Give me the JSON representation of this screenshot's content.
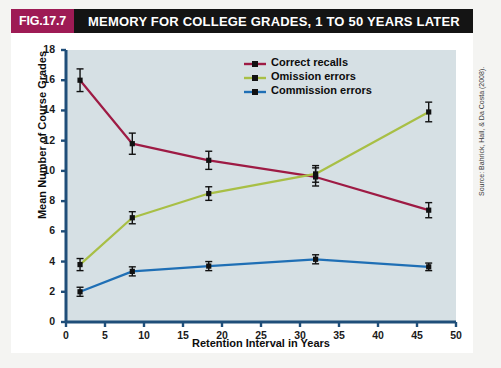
{
  "figure": {
    "badge": "FIG.17.7",
    "title": "MEMORY FOR COLLEGE GRADES, 1 TO 50 YEARS LATER",
    "badge_color": "#9e1b55",
    "title_bar_color": "#141414",
    "plot_background": "#d6e0e4",
    "axis_color": "#1f4e79",
    "source": "Source: Bahrick, Hall, & Da Costa (2008)."
  },
  "legend": {
    "position": "top-right",
    "entries": [
      {
        "label": "Correct recalls",
        "color": "#9e1b44"
      },
      {
        "label": "Omission errors",
        "color": "#a8bf45"
      },
      {
        "label": "Commission errors",
        "color": "#1f6fb5"
      }
    ]
  },
  "chart_data": {
    "type": "line",
    "title": "MEMORY FOR COLLEGE GRADES, 1 TO 50 YEARS LATER",
    "xlabel": "Retention Interval in Years",
    "ylabel": "Mean Number of Course Grades",
    "xlim": [
      0,
      50
    ],
    "ylim": [
      0,
      18
    ],
    "xticks": [
      0,
      5,
      10,
      15,
      20,
      25,
      30,
      35,
      40,
      45,
      50
    ],
    "yticks": [
      0,
      2,
      4,
      6,
      8,
      10,
      12,
      14,
      16,
      18
    ],
    "grid": false,
    "x": [
      1.8,
      8.5,
      18.3,
      32.0,
      46.5
    ],
    "series": [
      {
        "name": "Correct recalls",
        "color": "#9e1b44",
        "values": [
          16.0,
          11.8,
          10.7,
          9.6,
          7.4
        ],
        "errors": [
          0.75,
          0.7,
          0.6,
          0.6,
          0.5
        ]
      },
      {
        "name": "Omission errors",
        "color": "#a8bf45",
        "values": [
          3.8,
          6.9,
          8.5,
          9.8,
          13.9
        ],
        "errors": [
          0.4,
          0.4,
          0.45,
          0.55,
          0.65
        ]
      },
      {
        "name": "Commission errors",
        "color": "#1f6fb5",
        "values": [
          2.0,
          3.35,
          3.7,
          4.15,
          3.65
        ],
        "errors": [
          0.3,
          0.3,
          0.3,
          0.3,
          0.25
        ]
      }
    ]
  }
}
